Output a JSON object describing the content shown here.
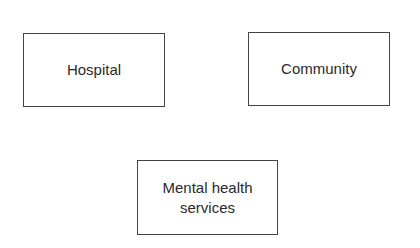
{
  "diagram": {
    "nodes": [
      {
        "id": "hospital",
        "label": "Hospital"
      },
      {
        "id": "community",
        "label": "Community"
      },
      {
        "id": "mental_health",
        "label": "Mental health services"
      }
    ],
    "edges": []
  }
}
